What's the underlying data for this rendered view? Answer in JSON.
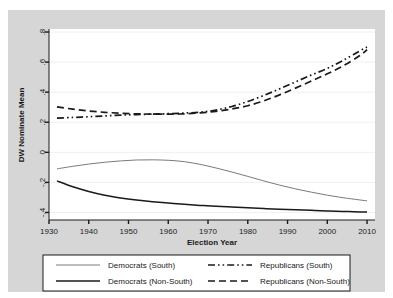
{
  "chart_data": {
    "type": "line",
    "title": "",
    "xlabel": "Election Year",
    "ylabel": "DW Nominate Mean",
    "xlim": [
      1930,
      2012
    ],
    "ylim": [
      -0.45,
      0.82
    ],
    "xticks": [
      1930,
      1940,
      1950,
      1960,
      1970,
      1980,
      1990,
      2000,
      2010
    ],
    "xtick_labels": [
      "1930",
      "1940",
      "1950",
      "1960",
      "1970",
      "1980",
      "1990",
      "2000",
      "2010"
    ],
    "yticks": [
      -0.4,
      -0.2,
      0,
      0.2,
      0.4,
      0.6,
      0.8
    ],
    "ytick_labels": [
      "-.4",
      "-.2",
      "0",
      ".2",
      ".4",
      ".6",
      ".8"
    ],
    "grid": "horizontal",
    "legend_position": "below-plot",
    "x": [
      1932,
      1936,
      1940,
      1944,
      1948,
      1952,
      1956,
      1960,
      1964,
      1968,
      1972,
      1976,
      1980,
      1984,
      1988,
      1992,
      1996,
      2000,
      2004,
      2008,
      2010
    ],
    "series": [
      {
        "name": "Democrats (South)",
        "style": "solid-thin",
        "color": "#6b6b6b",
        "values": [
          -0.11,
          -0.093,
          -0.078,
          -0.066,
          -0.057,
          -0.051,
          -0.05,
          -0.053,
          -0.062,
          -0.08,
          -0.104,
          -0.131,
          -0.16,
          -0.19,
          -0.218,
          -0.243,
          -0.265,
          -0.285,
          -0.302,
          -0.316,
          -0.323
        ]
      },
      {
        "name": "Democrats (Non-South)",
        "style": "solid-thick",
        "color": "#1a1a1a",
        "values": [
          -0.19,
          -0.229,
          -0.26,
          -0.285,
          -0.303,
          -0.317,
          -0.328,
          -0.337,
          -0.346,
          -0.353,
          -0.359,
          -0.364,
          -0.369,
          -0.374,
          -0.378,
          -0.382,
          -0.386,
          -0.39,
          -0.393,
          -0.396,
          -0.397
        ]
      },
      {
        "name": "Republicans (South)",
        "style": "dash-dot-dot",
        "color": "#1a1a1a",
        "values": [
          0.228,
          0.232,
          0.237,
          0.242,
          0.247,
          0.251,
          0.254,
          0.257,
          0.261,
          0.267,
          0.281,
          0.305,
          0.338,
          0.378,
          0.422,
          0.468,
          0.514,
          0.558,
          0.612,
          0.672,
          0.7
        ]
      },
      {
        "name": "Republicans (Non-South)",
        "style": "dashed",
        "color": "#1a1a1a",
        "values": [
          0.302,
          0.287,
          0.275,
          0.266,
          0.26,
          0.256,
          0.254,
          0.254,
          0.256,
          0.262,
          0.272,
          0.288,
          0.31,
          0.342,
          0.382,
          0.427,
          0.474,
          0.522,
          0.575,
          0.64,
          0.682
        ]
      }
    ]
  },
  "axes": {
    "y_title": "DW Nominate Mean",
    "x_title": "Election Year",
    "y_tick_0": ".8",
    "y_tick_1": ".6",
    "y_tick_2": ".4",
    "y_tick_3": ".2",
    "y_tick_4": "0",
    "y_tick_5": "-.2",
    "y_tick_6": "-.4",
    "x_tick_0": "1930",
    "x_tick_1": "1940",
    "x_tick_2": "1950",
    "x_tick_3": "1960",
    "x_tick_4": "1970",
    "x_tick_5": "1980",
    "x_tick_6": "1990",
    "x_tick_7": "2000",
    "x_tick_8": "2010"
  },
  "legend": {
    "entries": [
      {
        "label": "Democrats (South)",
        "style": "solid-thin"
      },
      {
        "label": "Republicans (South)",
        "style": "dash-dot-dot"
      },
      {
        "label": "Democrats (Non-South)",
        "style": "solid-thick"
      },
      {
        "label": "Republicans (Non-South)",
        "style": "dashed"
      }
    ]
  },
  "colors": {
    "outer_frame": "#d6d6d6",
    "plot_background": "#ffffff",
    "axis": "#1a1a1a",
    "gridline": "#f0f0f0",
    "thin_line": "#6b6b6b",
    "thick_line": "#1a1a1a"
  }
}
